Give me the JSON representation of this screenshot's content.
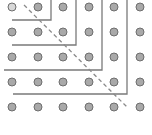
{
  "diagram": {
    "title": "",
    "type": "dot-grid-gnomons",
    "colors": {
      "background": "#ffffff",
      "dot_fill": "#a9a9a9",
      "dot_stroke": "#6e6e6e",
      "line": "#7a7a7a",
      "dashed": "#8a8a8a"
    },
    "grid": {
      "columns": 6,
      "rows": 5,
      "x": [
        12,
        38,
        63,
        89,
        114,
        140
      ],
      "y": [
        7,
        32,
        57,
        82,
        107
      ],
      "dot_radius": 4
    },
    "gnomons": [
      {
        "h_start": 12,
        "h_end": 51,
        "y": 20,
        "x": 51,
        "v_start": 0
      },
      {
        "h_start": 12,
        "h_end": 76,
        "y": 45,
        "x": 76,
        "v_start": 0
      },
      {
        "h_start": 4,
        "h_end": 102,
        "y": 70,
        "x": 102,
        "v_start": 0
      },
      {
        "h_start": 13,
        "h_end": 127,
        "y": 94,
        "x": 127,
        "v_start": 0
      }
    ],
    "diagonal": {
      "x1": 24,
      "y1": 5,
      "x2": 128,
      "y2": 108,
      "dash": "4,3"
    }
  }
}
